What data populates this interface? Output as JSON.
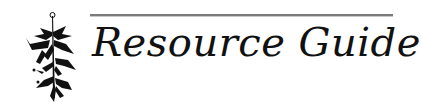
{
  "header": {
    "title": "Resource Guide",
    "icon": "lily-flower-icon"
  },
  "colors": {
    "text": "#111111",
    "rule": "#7a7a7a",
    "background": "#ffffff"
  }
}
